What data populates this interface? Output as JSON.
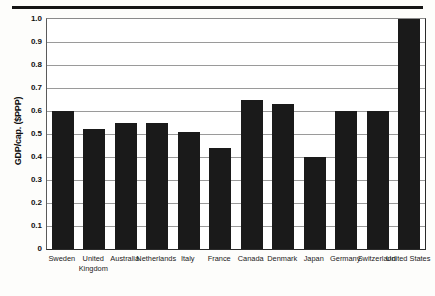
{
  "figure": {
    "background_color": "#fdfdfb",
    "bar_color": "#1a1a1a",
    "gridline_color": "#9a9a9a",
    "axis_color": "#2a2a2a",
    "top_rule": "horizontal-rule"
  },
  "chart_data": {
    "type": "bar",
    "title": "",
    "xlabel": "",
    "ylabel": "GDP/cap. ($PPP)",
    "ylim": [
      0,
      1.0
    ],
    "yticks": [
      "0",
      "0.1",
      "0.2",
      "0.3",
      "0.4",
      "0.5",
      "0.6",
      "0.7",
      "0.8",
      "0.9",
      "1.0"
    ],
    "ytick_values": [
      0,
      0.1,
      0.2,
      0.3,
      0.4,
      0.5,
      0.6,
      0.7,
      0.8,
      0.9,
      1.0
    ],
    "grid": true,
    "legend": "none",
    "categories": [
      "Sweden",
      "United Kingdom",
      "Australia",
      "Netherlands",
      "Italy",
      "France",
      "Canada",
      "Denmark",
      "Japan",
      "Germany",
      "Switzerland",
      "United States"
    ],
    "values": [
      0.6,
      0.52,
      0.55,
      0.55,
      0.51,
      0.44,
      0.65,
      0.63,
      0.4,
      0.6,
      0.6,
      1.0
    ]
  }
}
